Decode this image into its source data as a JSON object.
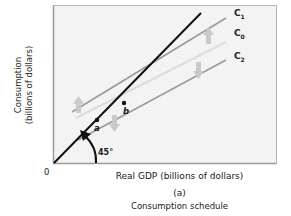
{
  "figure": {
    "y_axis_label_line1": "Consumption",
    "y_axis_label_line2": "(billions of dollars)",
    "x_axis_label": "Real GDP (billions of dollars)",
    "origin_label": "0",
    "panel_label": "(a)",
    "caption": "Consumption schedule",
    "angle_label": "45°",
    "points": [
      {
        "label": "a"
      },
      {
        "label": "b"
      }
    ],
    "curves": [
      {
        "name": "C",
        "subscript": "1",
        "description": "shifted up"
      },
      {
        "name": "C",
        "subscript": "0",
        "description": "original"
      },
      {
        "name": "C",
        "subscript": "2",
        "description": "shifted down"
      }
    ],
    "reference_line": "45-degree line",
    "colors": {
      "plot_background": "#f3f3f3",
      "frame": "#9a9a9a",
      "reference_line": "#111111",
      "consumption_lines": "#9a9a9a",
      "c0_line": "#dedede",
      "shift_arrows": "#c9c9c9"
    }
  }
}
